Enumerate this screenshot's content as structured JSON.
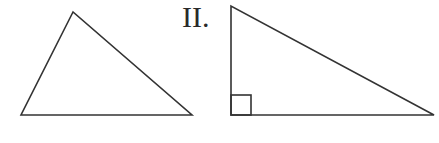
{
  "figure": {
    "label": "II.",
    "stroke_color": "#333333",
    "shapes": [
      {
        "name": "triangle-1",
        "type": "scalene-triangle",
        "vertices": [
          [
            73,
            12
          ],
          [
            21,
            115
          ],
          [
            192,
            115
          ]
        ],
        "right_angle_marker": false
      },
      {
        "name": "triangle-2",
        "type": "right-triangle",
        "vertices": [
          [
            231,
            6
          ],
          [
            231,
            115
          ],
          [
            434,
            115
          ]
        ],
        "right_angle_marker": true,
        "right_angle_vertex": [
          231,
          115
        ]
      }
    ]
  }
}
